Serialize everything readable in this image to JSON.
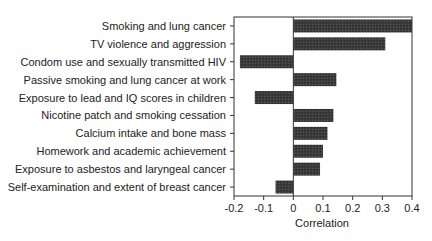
{
  "chart_data": {
    "type": "bar",
    "orientation": "horizontal",
    "title": "",
    "xlabel": "Correlation",
    "ylabel": "",
    "xlim": [
      -0.2,
      0.4
    ],
    "xticks": [
      -0.2,
      -0.1,
      0,
      0.1,
      0.2,
      0.3,
      0.4
    ],
    "xtick_labels": [
      "-0.2",
      "-0.1",
      "0",
      "0.1",
      "0.2",
      "0.3",
      "0.4"
    ],
    "grid": false,
    "legend": null,
    "categories": [
      "Smoking and lung cancer",
      "TV violence and aggression",
      "Condom use and sexually transmitted HIV",
      "Passive smoking and lung cancer at work",
      "Exposure to lead and IQ scores in children",
      "Nicotine patch and smoking cessation",
      "Calcium intake and bone mass",
      "Homework and academic achievement",
      "Exposure to asbestos and laryngeal cancer",
      "Self-examination and extent of breast cancer"
    ],
    "values": [
      0.4,
      0.31,
      -0.18,
      0.145,
      -0.13,
      0.135,
      0.115,
      0.1,
      0.09,
      -0.06
    ],
    "bar_color": "#3a3a3a"
  }
}
